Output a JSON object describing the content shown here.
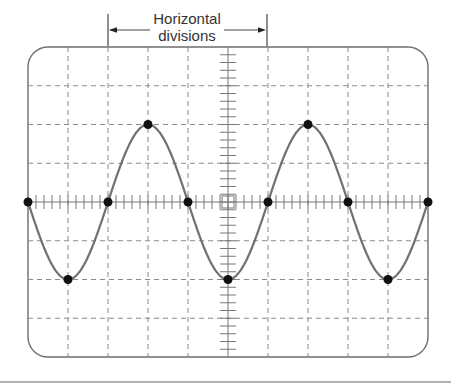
{
  "diagram": {
    "type": "oscilloscope-display",
    "annotation": {
      "line1": "Horizontal",
      "line2": "divisions",
      "spans_from_division": 2,
      "spans_to_division": 6
    },
    "grid": {
      "horizontal_divisions": 10,
      "vertical_divisions": 8,
      "minor_ticks_per_division": 5,
      "center_graticule_marker": true
    },
    "waveform": {
      "shape": "sine",
      "initial_phase": "starting at zero, going negative",
      "amplitude_divisions": 2,
      "period_divisions": 4,
      "cycles_shown": 2.5,
      "marked_points": [
        {
          "div_x": 0,
          "div_y": 0
        },
        {
          "div_x": 1,
          "div_y": -2
        },
        {
          "div_x": 2,
          "div_y": 0
        },
        {
          "div_x": 3,
          "div_y": 2
        },
        {
          "div_x": 4,
          "div_y": 0
        },
        {
          "div_x": 5,
          "div_y": -2
        },
        {
          "div_x": 6,
          "div_y": 0
        },
        {
          "div_x": 7,
          "div_y": 2
        },
        {
          "div_x": 8,
          "div_y": 0
        },
        {
          "div_x": 9,
          "div_y": -2
        },
        {
          "div_x": 10,
          "div_y": 0
        }
      ]
    },
    "colors": {
      "frame": "#6e6e6e",
      "grid": "#8a8a8a",
      "axis": "#777777",
      "curve": "#707070",
      "points": "#111111",
      "text": "#333333",
      "separator": "#999999"
    }
  }
}
